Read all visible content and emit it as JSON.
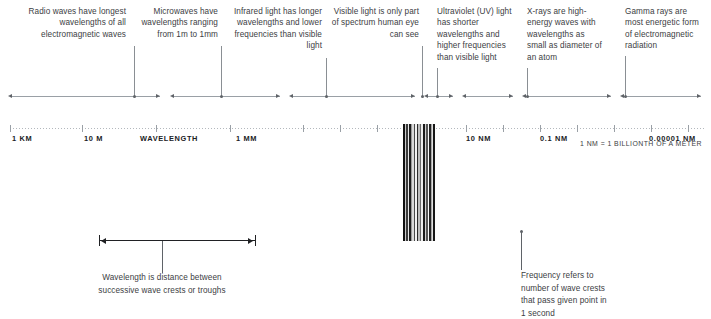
{
  "diagram": {
    "accent_color": "#3c4043",
    "axis_color": "#9aa0a6"
  },
  "callouts": [
    {
      "id": "radio",
      "name": "callout-radio-waves",
      "text": "Radio waves have longest wavelengths of all electromagnetic waves",
      "align": "right",
      "x": 8,
      "y": 6,
      "width": 118,
      "leader_x": 134,
      "leader_top": 46,
      "leader_height": 50
    },
    {
      "id": "microwave",
      "name": "callout-microwaves",
      "text": "Microwaves have wavelengths ranging from 1m to 1mm",
      "align": "right",
      "x": 128,
      "y": 6,
      "width": 90,
      "leader_x": 221,
      "leader_top": 46,
      "leader_height": 50
    },
    {
      "id": "infrared",
      "name": "callout-infrared",
      "text": "Infrared light has longer wavelengths and lower frequencies than visible light",
      "align": "right",
      "x": 222,
      "y": 6,
      "width": 100,
      "leader_x": 326,
      "leader_top": 58,
      "leader_height": 38
    },
    {
      "id": "visible",
      "name": "callout-visible-light",
      "text": "Visible light is only part of spectrum human eye can see",
      "align": "right",
      "x": 330,
      "y": 6,
      "width": 89,
      "leader_x": 422,
      "leader_top": 46,
      "leader_height": 50
    },
    {
      "id": "ultraviolet",
      "name": "callout-ultraviolet",
      "text": "Ultraviolet (UV) light has shorter wavelengths and higher frequencies than visible light",
      "align": "left",
      "x": 437,
      "y": 6,
      "width": 80,
      "leader_x": 437,
      "leader_top": 68,
      "leader_height": 28
    },
    {
      "id": "xray",
      "name": "callout-x-rays",
      "text": "X-rays are high-energy waves with wavelengths as small as diameter of an atom",
      "align": "left",
      "x": 527,
      "y": 6,
      "width": 78,
      "leader_x": 527,
      "leader_top": 68,
      "leader_height": 28
    },
    {
      "id": "gamma",
      "name": "callout-gamma-rays",
      "text": "Gamma rays are most energetic form of electromagnetic radiation",
      "align": "left",
      "x": 625,
      "y": 6,
      "width": 82,
      "leader_x": 625,
      "leader_top": 56,
      "leader_height": 40
    }
  ],
  "axis": {
    "y": 96,
    "start_x": 10,
    "end_x": 701,
    "segment_breaks": [
      160,
      170,
      280,
      289,
      415,
      424,
      453,
      462,
      513,
      522,
      611,
      620
    ],
    "dots": [
      134,
      221,
      326,
      422,
      437,
      527,
      625
    ],
    "end_arrow_left_x": 8,
    "end_arrow_right_x": 697
  },
  "ruler": {
    "y": 128,
    "start_x": 10,
    "end_x": 705,
    "ticks": [
      10,
      82,
      156,
      230,
      303,
      340,
      377,
      414,
      429,
      466,
      503,
      540,
      577,
      614,
      651,
      688
    ],
    "labels": [
      {
        "name": "ruler-label-1km",
        "text": "1 KM",
        "x": 12,
        "anchor": "left"
      },
      {
        "name": "ruler-label-10m",
        "text": "10 M",
        "x": 84,
        "anchor": "left"
      },
      {
        "name": "ruler-label-wavelength",
        "text": "WAVELENGTH",
        "x": 140,
        "anchor": "left"
      },
      {
        "name": "ruler-label-1mm",
        "text": "1 MM",
        "x": 236,
        "anchor": "left"
      },
      {
        "name": "ruler-label-10nm",
        "text": "10 NM",
        "x": 466,
        "anchor": "left"
      },
      {
        "name": "ruler-label-01nm",
        "text": "0.1 NM",
        "x": 540,
        "anchor": "left"
      },
      {
        "name": "ruler-label-000001nm",
        "text": "0.00001 NM",
        "x": 649,
        "anchor": "left"
      }
    ],
    "note": "1 NM = 1 BILLIONTH OF A METER",
    "note_x": 580,
    "note_y": 140
  },
  "visible_spectrum": {
    "name": "visible-light-spectrum-bars",
    "x": 403,
    "y": 124,
    "width": 32,
    "height": 117,
    "stripes": [
      {
        "color": "#111111",
        "width": 2
      },
      {
        "color": "#c9c9c9",
        "width": 1
      },
      {
        "color": "#3a3a3a",
        "width": 2
      },
      {
        "color": "#e8e8e8",
        "width": 1
      },
      {
        "color": "#1c1c1c",
        "width": 2
      },
      {
        "color": "#9a9a9a",
        "width": 1
      },
      {
        "color": "#d8d8d8",
        "width": 2
      },
      {
        "color": "#4a4a4a",
        "width": 1
      },
      {
        "color": "#f2f2f2",
        "width": 2
      },
      {
        "color": "#2a2a2a",
        "width": 1
      },
      {
        "color": "#bdbdbd",
        "width": 2
      },
      {
        "color": "#6e6e6e",
        "width": 1
      },
      {
        "color": "#ededed",
        "width": 2
      },
      {
        "color": "#1a1a1a",
        "width": 2
      },
      {
        "color": "#d0d0d0",
        "width": 1
      },
      {
        "color": "#555555",
        "width": 2
      },
      {
        "color": "#fafafa",
        "width": 1
      },
      {
        "color": "#232323",
        "width": 2
      },
      {
        "color": "#a8a8a8",
        "width": 1
      },
      {
        "color": "#e0e0e0",
        "width": 1
      },
      {
        "color": "#161616",
        "width": 2
      }
    ]
  },
  "wavelength_measure": {
    "name": "wavelength-measure-bar",
    "left_x": 99,
    "right_x": 255,
    "y": 240,
    "stem_x": 162,
    "stem_top": 241,
    "stem_height": 32,
    "note": "Wavelength is distance between successive wave crests or troughs",
    "note_x": 162,
    "note_y": 272,
    "note_width": 150
  },
  "frequency_note": {
    "name": "frequency-note",
    "stem_x": 521,
    "stem_top": 232,
    "stem_height": 38,
    "dot_x": 521,
    "dot_y": 231,
    "note": "Frequency refers to number of wave crests that pass given point in 1 second",
    "note_x": 521,
    "note_y": 270,
    "note_width": 92
  }
}
